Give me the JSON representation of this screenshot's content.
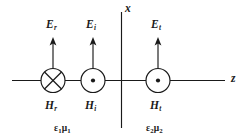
{
  "figure": {
    "axes": [
      {
        "name": "x",
        "label": "x",
        "orientation": "vertical"
      },
      {
        "name": "z",
        "label": "z",
        "orientation": "horizontal"
      }
    ],
    "interface_position_z": 0,
    "waves": [
      {
        "id": "reflected",
        "e_label": "E",
        "e_sub": "r",
        "h_label": "H",
        "h_sub": "r",
        "e_direction": "up",
        "h_direction": "into-page",
        "h_symbol": "cross",
        "cx": 53
      },
      {
        "id": "incident",
        "e_label": "E",
        "e_sub": "i",
        "h_label": "H",
        "h_sub": "i",
        "e_direction": "up",
        "h_direction": "out-of-page",
        "h_symbol": "dot",
        "cx": 93
      },
      {
        "id": "transmitted",
        "e_label": "E",
        "e_sub": "t",
        "h_label": "H",
        "h_sub": "t",
        "e_direction": "up",
        "h_direction": "out-of-page",
        "h_symbol": "dot",
        "cx": 158
      }
    ],
    "media": [
      {
        "id": "medium-1",
        "epsilon": "ε",
        "epsilon_sub": "1",
        "mu": "μ",
        "mu_sub": "1",
        "text": "ε₁μ₁"
      },
      {
        "id": "medium-2",
        "epsilon": "ε",
        "epsilon_sub": "2",
        "mu": "μ",
        "mu_sub": "2",
        "text": "ε₂μ₂"
      }
    ],
    "colors": {
      "stroke": "#1a1a1a",
      "background": "#ffffff"
    }
  }
}
